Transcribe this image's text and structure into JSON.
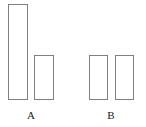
{
  "chart_data": {
    "type": "bar",
    "title": "",
    "subtitle": "",
    "xlabel": "",
    "ylabel": "",
    "categories": [
      "A",
      "B"
    ],
    "series": [
      {
        "name": "series-1",
        "values": [
          96,
          45
        ]
      },
      {
        "name": "series-2",
        "values": [
          45,
          45
        ]
      }
    ],
    "bars": [
      {
        "id": "bar-a-1",
        "group": "A",
        "series": "series-1",
        "value": 96,
        "x": 8,
        "y": 4,
        "width": 20,
        "height": 96
      },
      {
        "id": "bar-a-2",
        "group": "A",
        "series": "series-2",
        "value": 45,
        "x": 34,
        "y": 55,
        "width": 20,
        "height": 45
      },
      {
        "id": "bar-b-1",
        "group": "B",
        "series": "series-1",
        "value": 45,
        "x": 89,
        "y": 55,
        "width": 19,
        "height": 45
      },
      {
        "id": "bar-b-2",
        "group": "B",
        "series": "series-2",
        "value": 45,
        "x": 115,
        "y": 55,
        "width": 19,
        "height": 45
      }
    ],
    "ylim": [
      0,
      100
    ],
    "grid": false,
    "axes_visible": false,
    "legend": {
      "visible": false,
      "position": "none",
      "entries": []
    },
    "annotations": []
  },
  "axis": {
    "tick_labels": [
      {
        "text": "A",
        "center_x": 31,
        "top": 109
      },
      {
        "text": "B",
        "center_x": 111,
        "top": 109
      }
    ]
  },
  "style": {
    "background": "#ffffff",
    "bar_fill": "#ffffff",
    "bar_stroke": "#808080",
    "label_color": "#1a1a1a"
  }
}
